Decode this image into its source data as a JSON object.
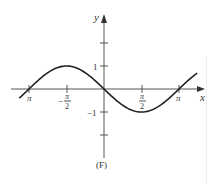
{
  "chart_data": {
    "type": "line",
    "title": "",
    "caption": "(F)",
    "function": "y = -sin(x)",
    "xlabel": "x",
    "ylabel": "y",
    "xlim": [
      -3.6,
      4.0
    ],
    "ylim": [
      -3.0,
      3.6
    ],
    "grid": false,
    "legend": null,
    "x_ticks": [
      {
        "value": -3.14159,
        "label": "π"
      },
      {
        "value": -1.5708,
        "label_num": "π",
        "label_den": "2",
        "sign": "−"
      },
      {
        "value": 1.5708,
        "label_num": "π",
        "label_den": "2",
        "sign": ""
      },
      {
        "value": 3.14159,
        "label": "π"
      }
    ],
    "y_ticks": [
      {
        "value": 2,
        "label": ""
      },
      {
        "value": 1,
        "label": "1"
      },
      {
        "value": -1,
        "label": "−1"
      },
      {
        "value": -2,
        "label": ""
      }
    ],
    "series": [
      {
        "name": "-sin(x)",
        "x": [
          -3.6,
          -3.14159,
          -2.356,
          -1.5708,
          -0.785,
          0,
          0.785,
          1.5708,
          2.356,
          3.14159,
          3.9
        ],
        "y": [
          0.443,
          0,
          0.707,
          1,
          0.707,
          0,
          -0.707,
          -1,
          -0.707,
          0,
          0.688
        ]
      }
    ]
  },
  "labels": {
    "x_axis": "x",
    "y_axis": "y",
    "tick_neg_pi": "π",
    "tick_pi": "π",
    "tick_neg_half_pi_sign": "−",
    "tick_half_pi_num": "π",
    "tick_half_pi_den": "2",
    "tick_y_1": "1",
    "tick_y_neg1": "−1",
    "caption": "(F)"
  }
}
